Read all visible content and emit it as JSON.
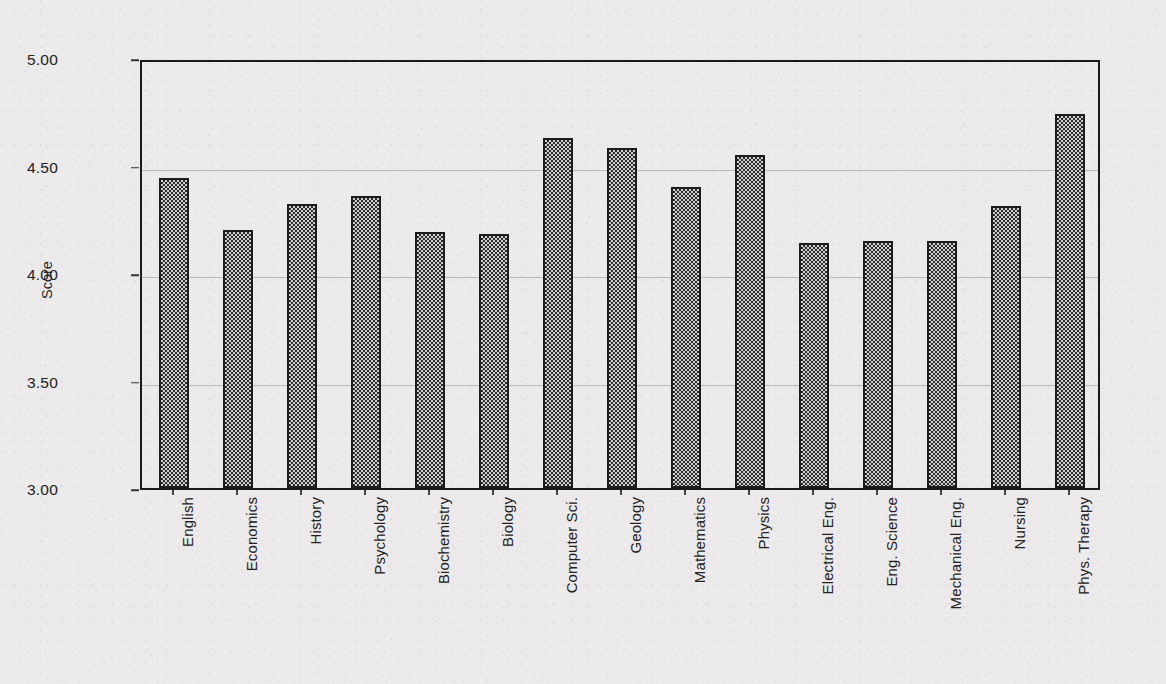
{
  "chart_data": {
    "type": "bar",
    "title": "",
    "subtitle": "",
    "xlabel": "",
    "ylabel": "Score",
    "ylim": [
      3.0,
      5.0
    ],
    "ytick_labels": [
      "5.00",
      "4.50",
      "4.00",
      "3.50",
      "3.00"
    ],
    "ytick_values": [
      5.0,
      4.5,
      4.0,
      3.5,
      3.0
    ],
    "grid": true,
    "grid_axis": "y",
    "legend": false,
    "legend_position": "none",
    "bar_fill": "checkered-hatch",
    "categories": [
      "English",
      "Economics",
      "History",
      "Psychology",
      "Biochemistry",
      "Biology",
      "Computer Sci.",
      "Geology",
      "Mathematics",
      "Physics",
      "Electrical Eng.",
      "Eng. Science",
      "Mechanical Eng.",
      "Nursing",
      "Phys. Therapy"
    ],
    "values": [
      4.44,
      4.2,
      4.32,
      4.36,
      4.19,
      4.18,
      4.63,
      4.58,
      4.4,
      4.55,
      4.14,
      4.15,
      4.15,
      4.31,
      4.74
    ]
  },
  "colors": {
    "background": "#ebeaea",
    "axis": "#1a1a1a",
    "gridline": "#b9b9b9",
    "bar_dark": "#2b2b2b",
    "bar_light": "#cfcfcf",
    "text": "#222222"
  }
}
